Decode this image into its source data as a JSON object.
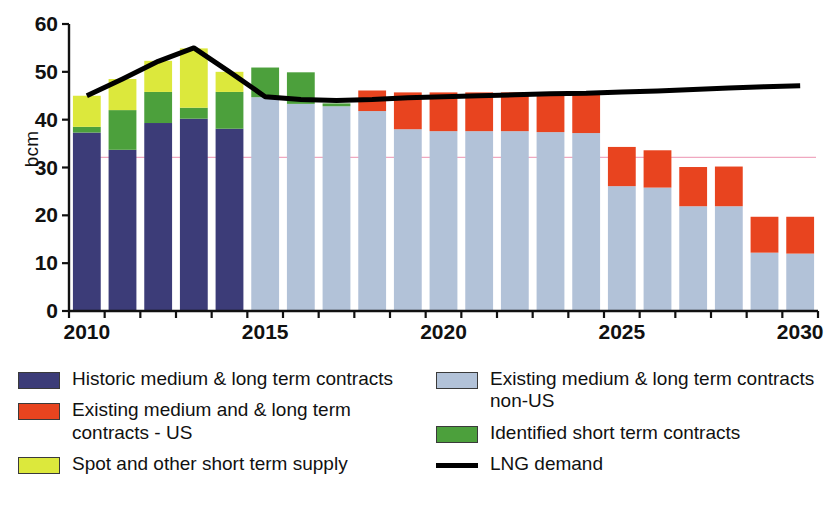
{
  "chart_data": {
    "type": "bar",
    "stacked": true,
    "title": "",
    "subtitle": "",
    "xlabel": "",
    "ylabel": "bcm",
    "ylim": [
      0,
      60
    ],
    "y_ticks": [
      0,
      10,
      20,
      30,
      40,
      50,
      60
    ],
    "x_tick_labels": [
      "2010",
      "2015",
      "2020",
      "2025",
      "2030"
    ],
    "grid": false,
    "legend_position": "bottom",
    "categories": [
      "2010",
      "2011",
      "2012",
      "2013",
      "2014",
      "2015",
      "2016",
      "2017",
      "2018",
      "2019",
      "2020",
      "2021",
      "2022",
      "2023",
      "2024",
      "2025",
      "2026",
      "2027",
      "2028",
      "2029",
      "2030"
    ],
    "series": [
      {
        "name": "Historic medium & long term contracts",
        "color": "#3c3c78",
        "values": [
          37.3,
          33.7,
          39.3,
          40.2,
          38.1,
          0,
          0,
          0,
          0,
          0,
          0,
          0,
          0,
          0,
          0,
          0,
          0,
          0,
          0,
          0,
          0
        ]
      },
      {
        "name": "Existing medium & long term contracts non-US",
        "color": "#b2c2d8",
        "values": [
          0,
          0,
          0,
          0,
          0,
          44.7,
          43.3,
          42.8,
          41.8,
          38.0,
          37.6,
          37.6,
          37.6,
          37.4,
          37.2,
          26.1,
          25.8,
          21.9,
          21.9,
          12.2,
          12.0
        ]
      },
      {
        "name": "Identified short term contracts",
        "color": "#4ca03c",
        "values": [
          1.2,
          8.3,
          6.5,
          2.3,
          7.7,
          6.2,
          6.6,
          0.6,
          0,
          0,
          0,
          0,
          0,
          0,
          0,
          0,
          0,
          0,
          0,
          0,
          0
        ]
      },
      {
        "name": "Existing medium and & long term contracts - US",
        "color": "#e8441f",
        "values": [
          0,
          0,
          0,
          0,
          0,
          0,
          0,
          0,
          4.3,
          7.7,
          8.1,
          8.1,
          8.1,
          8.2,
          8.2,
          8.2,
          7.8,
          8.2,
          8.3,
          7.5,
          7.7
        ]
      },
      {
        "name": "Spot and other short term supply",
        "color": "#dce83c",
        "values": [
          6.5,
          6.5,
          6.5,
          12.4,
          4.2,
          0,
          0,
          0,
          0,
          0,
          0,
          0,
          0,
          0,
          0,
          0,
          0,
          0,
          0,
          0,
          0
        ]
      }
    ],
    "line_series": {
      "name": "LNG demand",
      "color": "#000000",
      "x": [
        "2010",
        "2011",
        "2012",
        "2013",
        "2014",
        "2015",
        "2016",
        "2017",
        "2018",
        "2019",
        "2020",
        "2021",
        "2022",
        "2023",
        "2024",
        "2025",
        "2026",
        "2027",
        "2028",
        "2029",
        "2030"
      ],
      "values": [
        45.0,
        48.5,
        52.2,
        55.0,
        50.0,
        44.8,
        44.2,
        44.0,
        44.2,
        44.6,
        44.8,
        45.0,
        45.2,
        45.4,
        45.5,
        45.8,
        46.0,
        46.3,
        46.6,
        46.9,
        47.1
      ]
    }
  },
  "legend": {
    "left_items": [
      {
        "label": "Historic medium & long term contracts",
        "color": "#3c3c78",
        "kind": "swatch"
      },
      {
        "label": "Existing medium and & long term contracts - US",
        "color": "#e8441f",
        "kind": "swatch"
      },
      {
        "label": "Spot and other short term supply",
        "color": "#dce83c",
        "kind": "swatch"
      }
    ],
    "right_items": [
      {
        "label": "Existing medium & long term contracts non-US",
        "color": "#b2c2d8",
        "kind": "swatch"
      },
      {
        "label": "Identified short term contracts",
        "color": "#4ca03c",
        "kind": "swatch"
      },
      {
        "label": "LNG demand",
        "color": "#000000",
        "kind": "line"
      }
    ]
  }
}
